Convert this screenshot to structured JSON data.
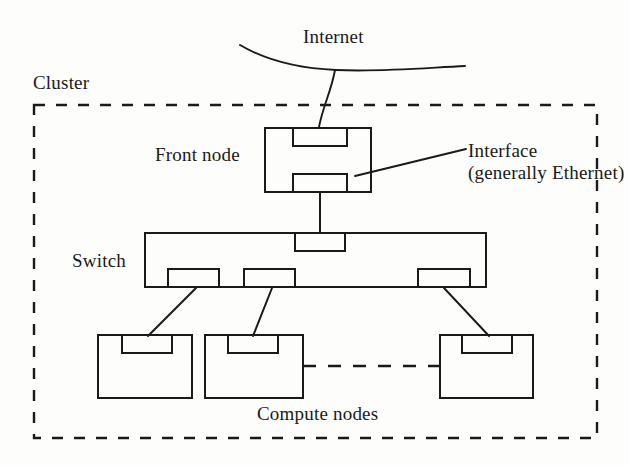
{
  "figure": {
    "type": "network-topology-diagram",
    "width": 629,
    "height": 465,
    "background_color": "#fdfdfc",
    "stroke_color": "#1a1a1a"
  },
  "labels": {
    "cluster": "Cluster",
    "internet": "Internet",
    "front_node": "Front node",
    "switch": "Switch",
    "compute_nodes": "Compute nodes",
    "interface_line1": "Interface",
    "interface_line2": "(generally Ethernet)"
  },
  "nodes": {
    "front_node": {
      "label": "Front node",
      "interfaces": [
        "top-interface",
        "bottom-interface"
      ]
    },
    "switch": {
      "label": "Switch",
      "uplink_ports": 1,
      "downlink_ports": 3
    },
    "compute_nodes": {
      "label": "Compute nodes",
      "count_shown": 3,
      "continuation": "dashed"
    }
  },
  "links": [
    {
      "from": "internet",
      "to": "front-node-top-interface",
      "style": "solid"
    },
    {
      "from": "front-node-bottom-interface",
      "to": "switch-uplink-port",
      "style": "solid"
    },
    {
      "from": "switch-port-1",
      "to": "compute-node-1",
      "style": "solid"
    },
    {
      "from": "switch-port-2",
      "to": "compute-node-2",
      "style": "solid"
    },
    {
      "from": "switch-port-3",
      "to": "compute-node-3",
      "style": "solid"
    },
    {
      "from": "compute-node-2",
      "to": "compute-node-3",
      "style": "dashed"
    }
  ],
  "annotations": [
    {
      "name": "interface-callout",
      "text_line1": "Interface",
      "text_line2": "(generally Ethernet)",
      "points_to": "front-node-bottom-interface"
    }
  ],
  "boundary": {
    "name": "cluster-boundary",
    "label": "Cluster",
    "style": "dashed"
  }
}
